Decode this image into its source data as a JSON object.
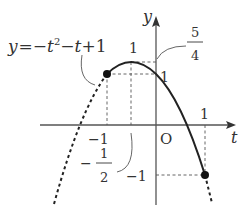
{
  "diagram": {
    "function_label": {
      "prefix": "y",
      "eq": "=",
      "minus1": "−",
      "t1": "t",
      "exp": "2",
      "minus2": "−",
      "t2": "t",
      "plus": "+",
      "one": "1"
    },
    "axes": {
      "x_label": "t",
      "y_label": "y",
      "origin_label": "O"
    },
    "ticks": {
      "t_pos1": "1",
      "t_neg1": "−1",
      "y_pos1": "1",
      "y_neg1": "−1",
      "vertex_t_sign": "−",
      "vertex_t_num": "1",
      "vertex_t_den": "2",
      "vertex_y_num": "5",
      "vertex_y_den": "4",
      "top_left_one": "1"
    },
    "points": {
      "left_endpoint": {
        "t": -1,
        "y": 1
      },
      "right_endpoint": {
        "t": 1,
        "y": -1
      },
      "vertex": {
        "t": -0.5,
        "y": 1.25
      }
    },
    "colors": {
      "stroke": "#222222",
      "axis": "#555555",
      "dashed_guide": "#555555"
    }
  }
}
